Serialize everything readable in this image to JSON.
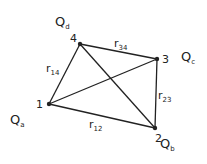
{
  "diagram": {
    "points": [
      {
        "id": "1",
        "charge": "Q",
        "charge_sub": "a"
      },
      {
        "id": "2",
        "charge": "Q",
        "charge_sub": "b"
      },
      {
        "id": "3",
        "charge": "Q",
        "charge_sub": "c"
      },
      {
        "id": "4",
        "charge": "Q",
        "charge_sub": "d"
      }
    ],
    "edges": [
      {
        "label": "r",
        "sub": "12"
      },
      {
        "label": "r",
        "sub": "23"
      },
      {
        "label": "r",
        "sub": "34"
      },
      {
        "label": "r",
        "sub": "14"
      }
    ]
  }
}
